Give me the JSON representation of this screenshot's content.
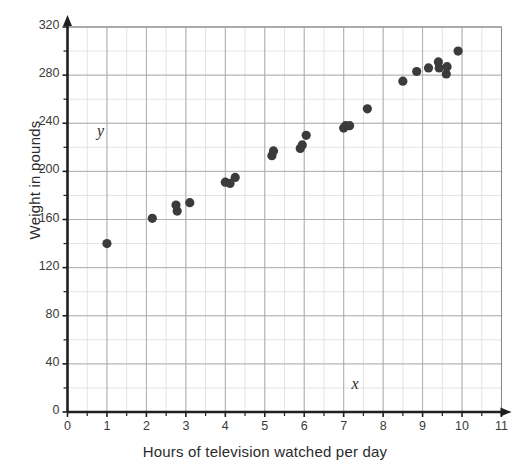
{
  "chart_data": {
    "type": "scatter",
    "title": "",
    "xlabel": "Hours of television watched per day",
    "ylabel": "Weight in pounds",
    "xlim": [
      0,
      11
    ],
    "ylim": [
      0,
      320
    ],
    "xticks": [
      0,
      1,
      2,
      3,
      4,
      5,
      6,
      7,
      8,
      9,
      10,
      11
    ],
    "yticks": [
      0,
      40,
      80,
      120,
      160,
      200,
      240,
      280,
      320
    ],
    "xtick_labels": [
      "0",
      "1",
      "2",
      "3",
      "4",
      "5",
      "6",
      "7",
      "8",
      "9",
      "10",
      "11"
    ],
    "ytick_labels": [
      "0",
      "40",
      "80",
      "120",
      "160",
      "200",
      "240",
      "280",
      "320"
    ],
    "minor_gridlines": true,
    "minor_x_step": 0.5,
    "minor_y_step": 20,
    "grid": true,
    "legend": "none",
    "annotations": [
      {
        "text": "y",
        "x": 0.85,
        "y": 232,
        "style": "italic"
      },
      {
        "text": "x",
        "x": 7.3,
        "y": 22,
        "style": "italic"
      }
    ],
    "series": [
      {
        "name": "Television hours vs weight",
        "marker": "circle",
        "color": "#3b3b3b",
        "points": [
          [
            1.0,
            140
          ],
          [
            2.15,
            161
          ],
          [
            2.75,
            172
          ],
          [
            2.78,
            167
          ],
          [
            3.1,
            174
          ],
          [
            4.0,
            191
          ],
          [
            4.12,
            190
          ],
          [
            4.25,
            195
          ],
          [
            5.18,
            213
          ],
          [
            5.22,
            217
          ],
          [
            5.9,
            219
          ],
          [
            5.95,
            222
          ],
          [
            6.05,
            230
          ],
          [
            7.0,
            236
          ],
          [
            7.05,
            238
          ],
          [
            7.15,
            238
          ],
          [
            7.6,
            252
          ],
          [
            8.5,
            275
          ],
          [
            8.85,
            283
          ],
          [
            9.15,
            286
          ],
          [
            9.4,
            291
          ],
          [
            9.42,
            286
          ],
          [
            9.6,
            281
          ],
          [
            9.62,
            287
          ],
          [
            9.9,
            300
          ]
        ]
      }
    ]
  },
  "axes": {
    "y_axis_label": "Weight in pounds",
    "x_axis_label": "Hours of television watched per day"
  }
}
